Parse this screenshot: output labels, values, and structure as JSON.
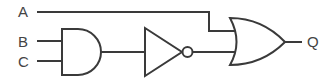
{
  "diagram": {
    "type": "logic-circuit",
    "inputs": [
      {
        "id": "A",
        "label": "A"
      },
      {
        "id": "B",
        "label": "B"
      },
      {
        "id": "C",
        "label": "C"
      }
    ],
    "gates": [
      {
        "id": "and1",
        "type": "AND",
        "inputs": [
          "B",
          "C"
        ]
      },
      {
        "id": "not1",
        "type": "NOT",
        "inputs": [
          "and1"
        ]
      },
      {
        "id": "or1",
        "type": "OR",
        "inputs": [
          "A",
          "not1"
        ]
      }
    ],
    "output": {
      "id": "Q",
      "label": "Q",
      "from": "or1"
    },
    "colors": {
      "stroke": "#3a3a3a",
      "text": "#444444",
      "background": "#ffffff"
    }
  }
}
